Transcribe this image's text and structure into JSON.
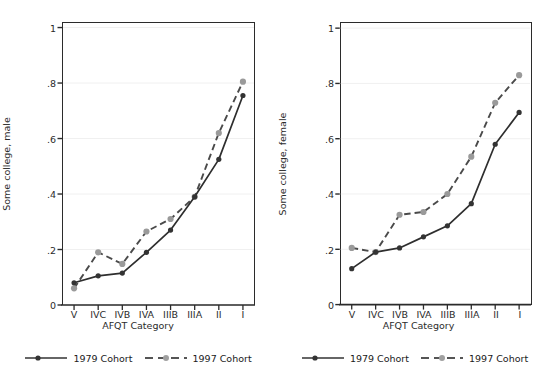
{
  "chart_data": [
    {
      "type": "line",
      "panel": "left",
      "title": "",
      "xlabel": "AFQT Category",
      "ylabel": "Some college, male",
      "categories": [
        "V",
        "IVC",
        "IVB",
        "IVA",
        "IIIB",
        "IIIA",
        "II",
        "I"
      ],
      "yticks": [
        "0",
        ".2",
        ".4",
        ".6",
        ".8",
        "1"
      ],
      "ytick_values": [
        0,
        0.2,
        0.4,
        0.6,
        0.8,
        1
      ],
      "ylim": [
        0,
        1.02
      ],
      "grid": "horizontal",
      "legend_position": "bottom",
      "series": [
        {
          "name": "1979 Cohort",
          "style": "solid",
          "color": "#333333",
          "values": [
            0.08,
            0.105,
            0.115,
            0.19,
            0.27,
            0.39,
            0.525,
            0.755
          ]
        },
        {
          "name": "1997 Cohort",
          "style": "dashed",
          "color": "#999999",
          "values": [
            0.06,
            0.19,
            0.148,
            0.265,
            0.31,
            0.39,
            0.62,
            0.805
          ]
        }
      ]
    },
    {
      "type": "line",
      "panel": "right",
      "title": "",
      "xlabel": "AFQT Category",
      "ylabel": "Some college, female",
      "categories": [
        "V",
        "IVC",
        "IVB",
        "IVA",
        "IIIB",
        "IIIA",
        "II",
        "I"
      ],
      "yticks": [
        "0",
        ".2",
        ".4",
        ".6",
        ".8",
        "1"
      ],
      "ytick_values": [
        0,
        0.2,
        0.4,
        0.6,
        0.8,
        1
      ],
      "ylim": [
        0,
        1.02
      ],
      "grid": "horizontal",
      "legend_position": "bottom",
      "series": [
        {
          "name": "1979 Cohort",
          "style": "solid",
          "color": "#333333",
          "values": [
            0.13,
            0.19,
            0.205,
            0.245,
            0.285,
            0.365,
            0.58,
            0.695
          ]
        },
        {
          "name": "1997 Cohort",
          "style": "dashed",
          "color": "#999999",
          "values": [
            0.205,
            0.19,
            0.325,
            0.335,
            0.4,
            0.535,
            0.73,
            0.83
          ]
        }
      ]
    }
  ],
  "colors": {
    "series_1979": "#333333",
    "series_1997": "#999999",
    "axis": "#2b2b2b",
    "gridline": "#f0f0f0",
    "background": "#ffffff"
  },
  "legend": {
    "left": [
      {
        "label": "1979 Cohort",
        "style": "solid"
      },
      {
        "label": "1997 Cohort",
        "style": "dashed"
      }
    ],
    "right": [
      {
        "label": "1979 Cohort",
        "style": "solid"
      },
      {
        "label": "1997 Cohort",
        "style": "dashed"
      }
    ]
  }
}
